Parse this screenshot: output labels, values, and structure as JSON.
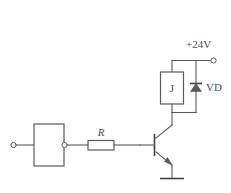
{
  "diagram": {
    "background_color": "#ffffff",
    "line_color": "#59595b",
    "labels": {
      "supply": "+24V",
      "diode": "VD",
      "relay": "J",
      "resistor": "R"
    },
    "components": [
      {
        "name": "input-block",
        "type": "rectangle-block",
        "label": ""
      },
      {
        "name": "resistor",
        "type": "resistor",
        "label": "R"
      },
      {
        "name": "transistor",
        "type": "npn-transistor",
        "label": ""
      },
      {
        "name": "relay-coil",
        "type": "coil-box",
        "label": "J"
      },
      {
        "name": "freewheel-diode",
        "type": "diode",
        "label": "VD"
      },
      {
        "name": "supply-terminal",
        "type": "open-terminal",
        "label": "+24V"
      },
      {
        "name": "ground",
        "type": "ground-bar",
        "label": ""
      }
    ]
  }
}
